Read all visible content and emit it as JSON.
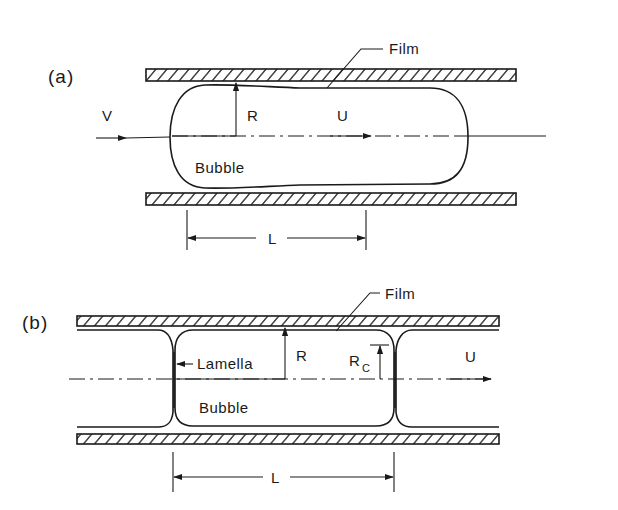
{
  "panels": {
    "a": {
      "label": "(a)",
      "film_label": "Film",
      "inlet_velocity_label": "V",
      "radius_label": "R",
      "bubble_velocity_label": "U",
      "bubble_label": "Bubble",
      "length_label": "L"
    },
    "b": {
      "label": "(b)",
      "film_label": "Film",
      "lamella_label": "Lamella",
      "radius_label": "R",
      "corner_radius_label": "R",
      "corner_radius_subscript": "C",
      "bubble_velocity_label": "U",
      "bubble_label": "Bubble",
      "length_label": "L"
    }
  }
}
